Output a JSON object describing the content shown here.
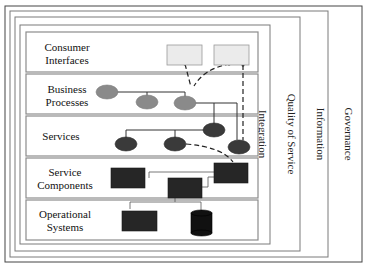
{
  "diagram": {
    "cross_cutting": {
      "governance": "Governance",
      "information": "Information",
      "quality_of_service": "Quality of Service",
      "integration": "Integration"
    },
    "layers": [
      {
        "id": "consumer",
        "line1": "Consumer",
        "line2": "Interfaces"
      },
      {
        "id": "business",
        "line1": "Business",
        "line2": "Processes"
      },
      {
        "id": "services",
        "line1": "Services",
        "line2": ""
      },
      {
        "id": "components",
        "line1": "Service",
        "line2": "Components"
      },
      {
        "id": "operational",
        "line1": "Operational",
        "line2": "Systems"
      }
    ],
    "nodes": {
      "consumer_interfaces": 2,
      "business_processes": 3,
      "services": 4,
      "service_components": 3,
      "operational_systems": {
        "systems": 1,
        "databases": 1
      }
    },
    "colors": {
      "ui_box": "#ebebeb",
      "business_node": "#8a8a8a",
      "service_node": "#3a3a3a",
      "component_box": "#262626",
      "frame": "#7a7a7a"
    }
  }
}
